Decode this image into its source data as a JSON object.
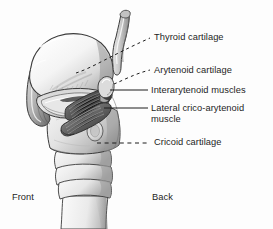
{
  "figure": {
    "background_color": "#fdfdfd",
    "ink_color": "#1d1d1d",
    "shading_colors": [
      "#ffffff",
      "#e9e9e9",
      "#cfcfcf",
      "#a8a8a8",
      "#7c7c7c",
      "#4f4f4f",
      "#2c2c2c"
    ]
  },
  "labels": [
    {
      "id": "thyroid",
      "text": "Thyroid cartilage",
      "leader": "dashed"
    },
    {
      "id": "arytenoid",
      "text": "Arytenoid cartilage",
      "leader": "dashed"
    },
    {
      "id": "inter",
      "text": "Interarytenoid muscles",
      "leader": "solid"
    },
    {
      "id": "lateral",
      "text": "Lateral crico-arytenoid\nmuscle",
      "leader": "solid"
    },
    {
      "id": "cricoid",
      "text": "Cricoid cartilage",
      "leader": "dashed"
    }
  ],
  "orientation": {
    "front": "Front",
    "back": "Back"
  },
  "structures": [
    {
      "name": "thyroid-cartilage",
      "kind": "cartilage"
    },
    {
      "name": "superior-horn",
      "kind": "cartilage"
    },
    {
      "name": "arytenoid-cartilage",
      "kind": "cartilage"
    },
    {
      "name": "interarytenoid-muscles",
      "kind": "muscle"
    },
    {
      "name": "lateral-crico-arytenoid-muscle",
      "kind": "muscle"
    },
    {
      "name": "cricoid-cartilage",
      "kind": "cartilage"
    },
    {
      "name": "tracheal-rings",
      "kind": "cartilage"
    },
    {
      "name": "inferior-horn",
      "kind": "cartilage"
    }
  ]
}
